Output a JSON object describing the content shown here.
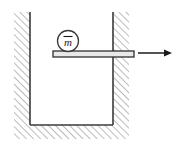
{
  "figure": {
    "background_color": "#ffffff",
    "line_color": "#3a3a3a",
    "hatch_color": "#808080",
    "rod_fill_color": "#e8e8e8",
    "arrow_color": "#1a1a1a"
  },
  "container": {
    "name": "hatched-u-container",
    "shape": "u-channel open top",
    "wall_thickness_px": 16,
    "left_wall": {
      "label": "left-wall",
      "x": 14,
      "y": 12,
      "width": 16,
      "height": 113
    },
    "right_wall": {
      "label": "right-wall",
      "x": 113,
      "y": 12,
      "width": 16,
      "height": 113
    },
    "floor": {
      "label": "floor",
      "x": 14,
      "y": 125,
      "width": 115,
      "height": 14
    },
    "hatch_direction": "forward-slash",
    "hatch_spacing_px": 5
  },
  "rod": {
    "name": "horizontal-rod",
    "x": 53,
    "y": 51,
    "width": 81,
    "height": 6,
    "passes_through": "right-wall"
  },
  "mass": {
    "name": "mass-marker",
    "symbol": "m",
    "has_overbar": true,
    "center_x": 68,
    "center_y": 41,
    "radius": 10.5
  },
  "force_arrow": {
    "name": "force-arrow-right",
    "direction": "right",
    "tail_x": 138,
    "tip_x": 172,
    "y": 53,
    "label": ""
  }
}
